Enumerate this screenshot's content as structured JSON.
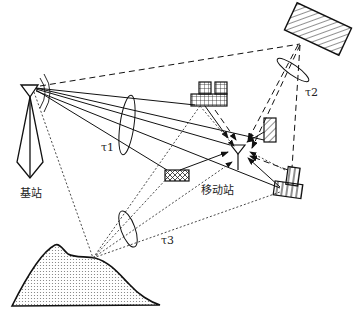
{
  "diagram": {
    "type": "multipath radio propagation",
    "labels": {
      "base_station": "基站",
      "mobile_station": "移动站",
      "tau1": "τ1",
      "tau2": "τ2",
      "tau3": "τ3"
    },
    "nodes": [
      {
        "id": "base-station",
        "label": "基站"
      },
      {
        "id": "mobile-station",
        "label": "移动站"
      },
      {
        "id": "distant-reflector",
        "pattern": "diagonal-hatch"
      },
      {
        "id": "building-cluster-grid",
        "pattern": "grid"
      },
      {
        "id": "small-building-right",
        "pattern": "diagonal-hatch"
      },
      {
        "id": "scatterer-block",
        "pattern": "crosshatch"
      },
      {
        "id": "building-cluster-vertical",
        "pattern": "vertical-lines"
      },
      {
        "id": "hill",
        "pattern": "dotted"
      }
    ],
    "path_groups": [
      {
        "label": "τ1",
        "style": "solid",
        "via": "local scatterers"
      },
      {
        "label": "τ2",
        "style": "dashed",
        "via": "distant reflector"
      },
      {
        "label": "τ3",
        "style": "dotted",
        "via": "hill"
      }
    ]
  }
}
